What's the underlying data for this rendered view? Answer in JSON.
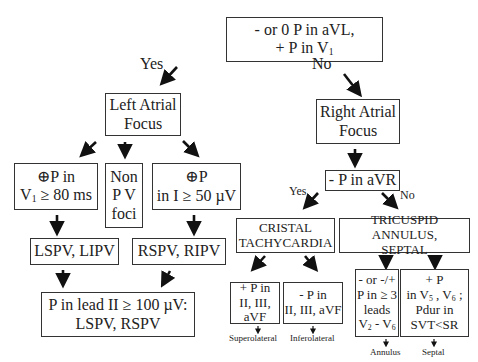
{
  "diagram": {
    "root": {
      "line1": "- or 0  P in aVL,",
      "line2": "+ P  in V",
      "line2_sub": "1"
    },
    "branch_labels": {
      "yes_top": "Yes",
      "no_top": "No",
      "yes_right": "Yes",
      "no_right": "No"
    },
    "left_atrial": {
      "line1": "Left Atrial",
      "line2": "Focus"
    },
    "right_atrial": {
      "line1": "Right Atrial",
      "line2": "Focus"
    },
    "left_criteria": {
      "a": {
        "prefix": "⊕",
        "line1": "P in",
        "line2_pre": "V",
        "line2_sub": "1",
        "line2_post": " ≥ 80  ms"
      },
      "b": {
        "line1": "Non",
        "line2": "P V",
        "line3": "foci"
      },
      "c": {
        "prefix": "⊕",
        "line1": "P",
        "line2": "in I ≥ 50 µV"
      }
    },
    "left_results": {
      "a": "LSPV, LIPV",
      "c": "RSPV, RIPV"
    },
    "left_final": {
      "line1": "P in lead II ≥ 100 µV:",
      "line2": "LSPV, RSPV"
    },
    "avr": {
      "text": "- P in aVR"
    },
    "cristal": {
      "line1": "CRISTAL",
      "line2": "TACHYCARDIA"
    },
    "tricuspid": {
      "line1": "TRICUSPID ANNULUS,",
      "line2": "SEPTAL"
    },
    "cristal_sub": {
      "a": {
        "line1": "+ P in",
        "line2": "II, III, aVF",
        "result": "Superolateral"
      },
      "b": {
        "line1": "- P in",
        "line2": "II, III, aVF",
        "result": "Inferolateral"
      }
    },
    "tricuspid_sub": {
      "a": {
        "line1": "- or -/+",
        "line2": "P in ≥ 3",
        "line3": "leads",
        "line4_a": "V",
        "line4_a_sub": "2",
        "line4_b": " - V",
        "line4_b_sub": "6",
        "result": "Annulus"
      },
      "b": {
        "line1": "+ P",
        "line2_a": "in V",
        "line2_a_sub": "5",
        "line2_b": " , V",
        "line2_b_sub": "6",
        "line2_c": " ;",
        "line3": "Pdur in",
        "line4": "SVT<SR",
        "result": "Septal"
      }
    }
  }
}
